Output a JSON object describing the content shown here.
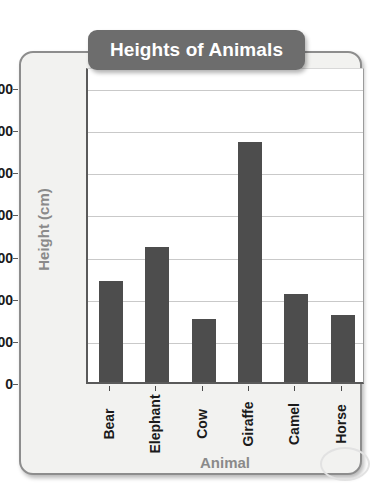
{
  "chart_data": {
    "type": "bar",
    "title": "Heights of Animals",
    "xlabel": "Animal",
    "ylabel": "Height (cm)",
    "categories": [
      "Bear",
      "Elephant",
      "Cow",
      "Giraffe",
      "Camel",
      "Horse"
    ],
    "values": [
      240,
      320,
      150,
      570,
      210,
      160
    ],
    "ylim": [
      0,
      750
    ],
    "yticks": [
      0,
      100,
      200,
      300,
      400,
      500,
      600,
      700
    ],
    "ytick_labels": [
      "0",
      "100",
      "200",
      "300",
      "400",
      "500",
      "600",
      "700"
    ],
    "grid": true,
    "legend": null,
    "bar_color": "#4d4d4d",
    "title_background": "#6d6d6d",
    "title_color": "#ffffff",
    "axis_label_color": "#8a8a8a",
    "plot_background": "#ffffff",
    "card_background": "#f2f2f0"
  }
}
